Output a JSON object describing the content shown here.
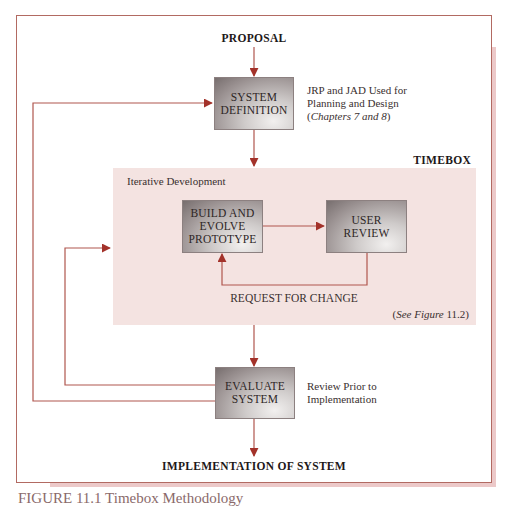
{
  "diagram": {
    "top_label": "PROPOSAL",
    "bottom_label": "IMPLEMENTATION OF SYSTEM",
    "boxes": {
      "system_definition": [
        "SYSTEM",
        "DEFINITION"
      ],
      "build_prototype": [
        "BUILD AND",
        "EVOLVE",
        "PROTOTYPE"
      ],
      "user_review": [
        "USER",
        "REVIEW"
      ],
      "evaluate_system": [
        "EVALUATE",
        "SYSTEM"
      ]
    },
    "notes": {
      "system_definition": {
        "line1": "JRP and JAD Used for",
        "line2": "Planning and Design",
        "line3_open": "(",
        "line3_italic": "Chapters 7 and 8",
        "line3_close": ")"
      },
      "evaluate_system": {
        "line1": "Review Prior to",
        "line2": "Implementation"
      }
    },
    "timebox": {
      "title": "TIMEBOX",
      "subtitle": "Iterative Development",
      "feedback_label": "REQUEST FOR CHANGE",
      "reference_open": "(",
      "reference_italic": "See Figure",
      "reference_num": " 11.2",
      "reference_close": ")"
    },
    "caption": "FIGURE 11.1 Timebox Methodology",
    "colors": {
      "arrow": "#a3322a",
      "line": "#b0564e",
      "frame_border": "#b26a62",
      "timebox_fill": "#f4e3e1",
      "shadow": "#ecc9c9"
    }
  }
}
